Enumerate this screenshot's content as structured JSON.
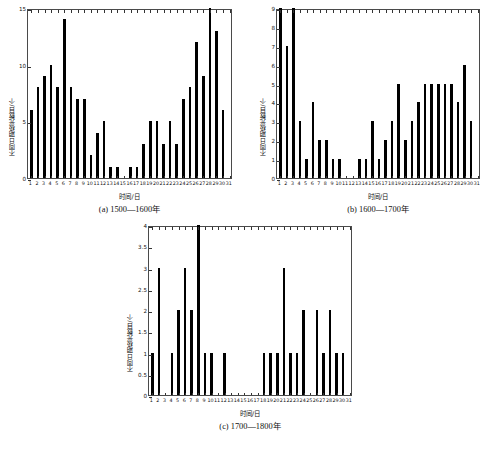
{
  "figure": {
    "ylabel": "不同日期极光数目/个",
    "xlabel": "时间/日"
  },
  "panels": [
    {
      "id": "a",
      "caption": "(a) 1500—1600年",
      "ylabel": "不同日期极光数目/个",
      "xlabel": "时间/日"
    },
    {
      "id": "b",
      "caption": "(b) 1600—1700年",
      "ylabel": "不同日期极光数目/个",
      "xlabel": "时间/日"
    },
    {
      "id": "c",
      "caption": "(c) 1700—1800年",
      "ylabel": "不同日期极光数目/个",
      "xlabel": "时间/日"
    }
  ],
  "chart_data": [
    {
      "type": "bar",
      "panel": "a",
      "title": "(a) 1500—1600年",
      "xlabel": "时间/日",
      "ylabel": "不同日期极光数目/个",
      "ylim": [
        0,
        15
      ],
      "yticks": [
        0,
        5,
        10,
        15
      ],
      "ytick_labels": [
        "0",
        "5",
        "10",
        "15"
      ],
      "grid": false,
      "legend": "none",
      "categories": [
        1,
        2,
        3,
        4,
        5,
        6,
        7,
        8,
        9,
        10,
        11,
        12,
        13,
        14,
        15,
        16,
        17,
        18,
        19,
        20,
        21,
        22,
        23,
        24,
        25,
        26,
        27,
        28,
        29,
        30,
        31
      ],
      "tick_labels": [
        "1",
        "2",
        "3",
        "4",
        "5",
        "6",
        "7",
        "8",
        "9",
        "10",
        "11",
        "12",
        "13",
        "14",
        "15",
        "16",
        "17",
        "18",
        "19",
        "20",
        "21",
        "22",
        "23",
        "24",
        "25",
        "26",
        "27",
        "28",
        "29",
        "30",
        "31"
      ],
      "values": [
        6,
        8,
        9,
        10,
        8,
        14,
        8,
        7,
        7,
        2,
        4,
        5,
        1,
        1,
        0,
        1,
        1,
        3,
        5,
        5,
        3,
        5,
        3,
        7,
        8,
        12,
        9,
        15,
        13,
        6,
        0
      ]
    },
    {
      "type": "bar",
      "panel": "b",
      "title": "(b) 1600—1700年",
      "xlabel": "时间/日",
      "ylabel": "不同日期极光数目/个",
      "ylim": [
        0,
        9
      ],
      "yticks": [
        0,
        1,
        2,
        3,
        4,
        5,
        6,
        7,
        8,
        9
      ],
      "ytick_labels": [
        "0",
        "1",
        "2",
        "3",
        "4",
        "5",
        "6",
        "7",
        "8",
        "9"
      ],
      "grid": false,
      "legend": "none",
      "categories": [
        1,
        2,
        3,
        4,
        5,
        6,
        7,
        8,
        9,
        10,
        11,
        12,
        13,
        14,
        15,
        16,
        17,
        18,
        19,
        20,
        21,
        22,
        23,
        24,
        25,
        26,
        27,
        28,
        29,
        30,
        31
      ],
      "tick_labels": [
        "1",
        "2",
        "3",
        "4",
        "5",
        "6",
        "7",
        "8",
        "9",
        "10",
        "11",
        "12",
        "13",
        "14",
        "15",
        "16",
        "17",
        "18",
        "19",
        "20",
        "21",
        "22",
        "23",
        "24",
        "25",
        "26",
        "27",
        "28",
        "29",
        "30",
        "31"
      ],
      "values": [
        9,
        7,
        9,
        3,
        1,
        4,
        2,
        2,
        1,
        1,
        0,
        0,
        1,
        1,
        3,
        1,
        2,
        3,
        5,
        2,
        3,
        4,
        5,
        5,
        5,
        5,
        5,
        4,
        6,
        3,
        0
      ]
    },
    {
      "type": "bar",
      "panel": "c",
      "title": "(c) 1700—1800年",
      "xlabel": "时间/日",
      "ylabel": "不同日期极光数目/个",
      "ylim": [
        0,
        4
      ],
      "yticks": [
        0,
        0.5,
        1,
        1.5,
        2,
        2.5,
        3,
        3.5,
        4
      ],
      "ytick_labels": [
        "0",
        "0.5",
        "1",
        "1.5",
        "2",
        "2.5",
        "3",
        "3.5",
        "4"
      ],
      "grid": false,
      "legend": "none",
      "categories": [
        1,
        2,
        3,
        4,
        5,
        6,
        7,
        8,
        9,
        10,
        11,
        12,
        13,
        14,
        15,
        16,
        17,
        18,
        19,
        20,
        21,
        22,
        23,
        24,
        25,
        26,
        27,
        28,
        29,
        30,
        31
      ],
      "tick_labels": [
        "1",
        "2",
        "3",
        "4",
        "5",
        "6",
        "7",
        "8",
        "9",
        "10",
        "11",
        "12",
        "13",
        "14",
        "15",
        "16",
        "17",
        "18",
        "19",
        "20",
        "21",
        "22",
        "23",
        "24",
        "25",
        "26",
        "27",
        "28",
        "29",
        "30",
        "31"
      ],
      "values": [
        1,
        3,
        0,
        1,
        2,
        3,
        2,
        4,
        1,
        1,
        0,
        1,
        0,
        0,
        0,
        0,
        0,
        1,
        1,
        1,
        3,
        1,
        1,
        2,
        0,
        2,
        1,
        2,
        1,
        1,
        0
      ]
    }
  ],
  "colors": {
    "bar": "#000000",
    "axis": "#4a4a4a",
    "text": "#111111",
    "background": "#ffffff"
  }
}
